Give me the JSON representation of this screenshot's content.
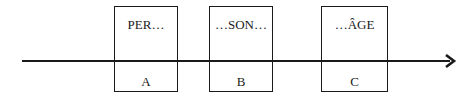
{
  "diagram": {
    "type": "timeline",
    "arrow_direction": "right",
    "line_color": "#1a1a1a",
    "boxes": [
      {
        "top_label": "PER…",
        "bottom_label": "A"
      },
      {
        "top_label": "…SON…",
        "bottom_label": "B"
      },
      {
        "top_label": "…ÂGE",
        "bottom_label": "C"
      }
    ]
  }
}
